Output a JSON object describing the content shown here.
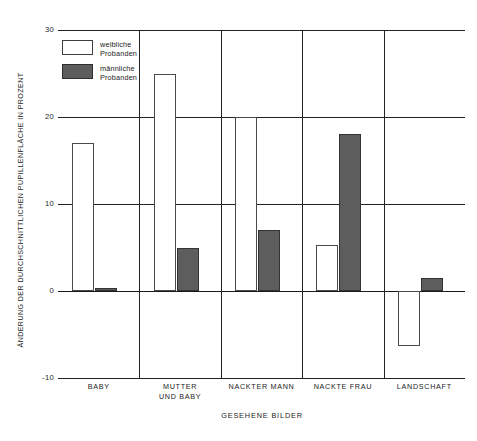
{
  "chart_data": {
    "type": "bar",
    "title": "",
    "xlabel": "GESEHENE BILDER",
    "ylabel": "ÄNDERUNG DER DURCHSCHNITTLICHEN PUPILLENFLÄCHE IN PROZENT",
    "categories": [
      "BABY",
      "MUTTER\nUND BABY",
      "NACKTER MANN",
      "NACKTE FRAU",
      "LANDSCHAFT"
    ],
    "series": [
      {
        "name": "weibliche\nProbanden",
        "key": "female",
        "color": "#ffffff",
        "edge_color": "#4a4a4a",
        "values": [
          17,
          25,
          20,
          5.3,
          -6.3
        ]
      },
      {
        "name": "männliche\nProbanden",
        "key": "male",
        "color": "#5d5d5d",
        "edge_color": "#333333",
        "values": [
          0.3,
          5,
          7,
          18,
          1.5
        ]
      }
    ],
    "ylim": [
      -10,
      30
    ],
    "yticks": [
      30,
      20,
      10,
      0,
      -10
    ],
    "ytick_labels": [
      "30",
      "20",
      "10",
      "0",
      "-10"
    ],
    "grid": "horizontal-gridlines-plus-category-separators",
    "legend_position": "top-left-inside"
  },
  "legend": {
    "items": [
      {
        "label": "weibliche\nProbanden",
        "style": "female"
      },
      {
        "label": "männliche\nProbanden",
        "style": "male"
      }
    ]
  }
}
